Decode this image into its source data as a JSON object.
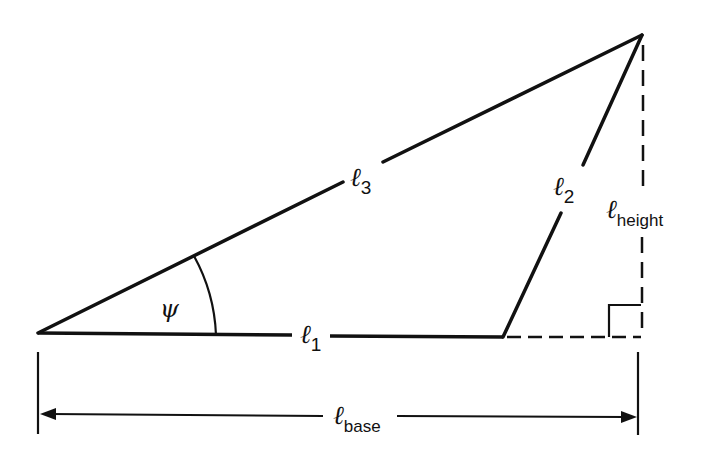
{
  "diagram": {
    "type": "triangle-geometry",
    "colors": {
      "stroke": "#111111",
      "background": "#ffffff"
    },
    "vertices": {
      "left": [
        38,
        333
      ],
      "top": [
        642,
        35
      ],
      "l2_base": [
        503,
        337
      ],
      "right_angle_corner": [
        641,
        337
      ]
    },
    "labels": {
      "l1": {
        "symbol": "ℓ",
        "subscript": "1"
      },
      "l2": {
        "symbol": "ℓ",
        "subscript": "2"
      },
      "l3": {
        "symbol": "ℓ",
        "subscript": "3"
      },
      "height": {
        "symbol": "ℓ",
        "subscript": "height"
      },
      "base": {
        "symbol": "ℓ",
        "subscript": "base"
      },
      "angle": "ψ"
    }
  }
}
